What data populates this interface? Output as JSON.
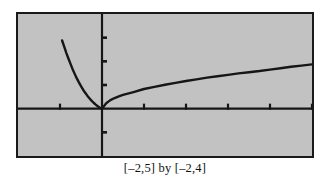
{
  "figure": {
    "caption": "[–2,5] by [–2,4]",
    "background_color": "#ffffff",
    "plot_background_color": "#c2c2c2",
    "frame_color": "#1a1a1a",
    "curve_color": "#161616"
  },
  "chart_data": {
    "type": "line",
    "title": "",
    "subtitle": "",
    "xlabel": "",
    "ylabel": "",
    "xlim": [
      -2,
      5
    ],
    "ylim": [
      -2,
      4
    ],
    "grid": false,
    "legend": null,
    "axes": {
      "x_axis_at_y": 0,
      "y_axis_at_x": 0,
      "x_ticks": [
        -1,
        1,
        2,
        3,
        4,
        5
      ],
      "y_ticks": [
        -1,
        1,
        2,
        3
      ],
      "tick_length_px": 5
    },
    "annotations": [
      "[–2,5] by [–2,4]"
    ],
    "series": [
      {
        "name": "left-branch",
        "comment": "steep branch rising to the upper left, meeting the origin at a cusp",
        "x": [
          -0.95,
          -0.9,
          -0.85,
          -0.8,
          -0.75,
          -0.7,
          -0.65,
          -0.6,
          -0.55,
          -0.5,
          -0.45,
          -0.4,
          -0.35,
          -0.3,
          -0.25,
          -0.2,
          -0.15,
          -0.1,
          -0.05,
          0.0
        ],
        "y": [
          2.88,
          2.62,
          2.36,
          2.12,
          1.89,
          1.67,
          1.47,
          1.28,
          1.11,
          0.95,
          0.8,
          0.67,
          0.55,
          0.44,
          0.34,
          0.25,
          0.17,
          0.1,
          0.04,
          0.0
        ]
      },
      {
        "name": "right-branch",
        "comment": "slowly rising concave-down root curve from the origin to the right edge",
        "x": [
          0.0,
          0.1,
          0.2,
          0.3,
          0.4,
          0.5,
          0.75,
          1.0,
          1.25,
          1.5,
          1.75,
          2.0,
          2.25,
          2.5,
          2.75,
          3.0,
          3.25,
          3.5,
          3.75,
          4.0,
          4.25,
          4.5,
          4.75,
          5.0
        ],
        "y": [
          0.0,
          0.23,
          0.36,
          0.45,
          0.52,
          0.58,
          0.7,
          0.83,
          0.92,
          1.01,
          1.09,
          1.17,
          1.24,
          1.31,
          1.37,
          1.43,
          1.49,
          1.54,
          1.59,
          1.65,
          1.71,
          1.77,
          1.82,
          1.87
        ]
      }
    ]
  }
}
